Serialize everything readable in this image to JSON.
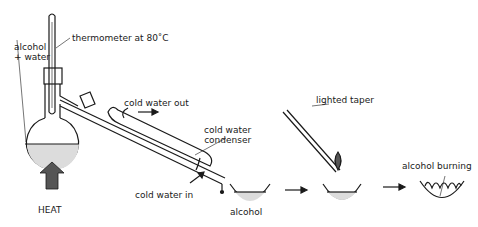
{
  "diagram": {
    "type": "distillation-process",
    "labels": {
      "alcohol_water_line1": "alcohol",
      "alcohol_water_line2": "+ water",
      "thermometer": "thermometer at 80˚C",
      "cold_water_out": "cold water out",
      "condenser_line1": "cold water",
      "condenser_line2": "condenser",
      "cold_water_in": "cold water in",
      "heat": "HEAT",
      "alcohol": "alcohol",
      "lighted_taper": "lighted taper",
      "alcohol_burning": "alcohol burning"
    },
    "colors": {
      "line": "#1a1a1a",
      "liquid": "#dcdcdc",
      "heat_arrow": "#555555"
    }
  }
}
